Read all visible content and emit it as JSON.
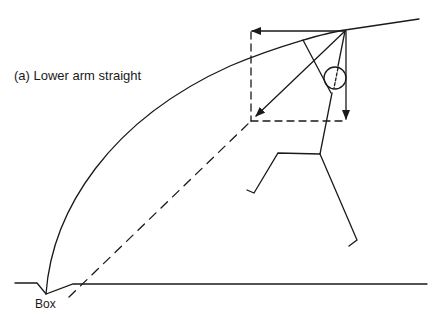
{
  "diagram": {
    "caption": "(a) Lower arm straight",
    "ground_label": "Box",
    "colors": {
      "ink": "#1a1a1a",
      "background": "#ffffff"
    },
    "elements": [
      "trajectory-curve",
      "ground-line-with-box",
      "resultant-force-arrow",
      "horizontal-component-arrow",
      "vertical-component-arrow",
      "force-parallelogram-dashed",
      "projection-line-dashed",
      "stick-figure-vaulter"
    ]
  }
}
